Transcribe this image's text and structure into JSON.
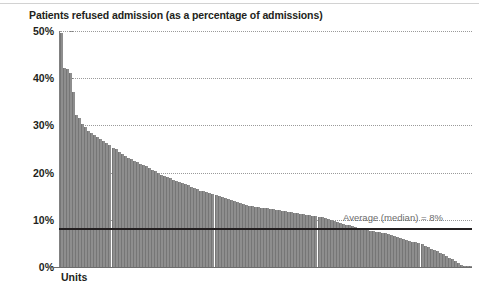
{
  "chart_data": {
    "type": "bar",
    "title": "Patients refused admission (as a percentage of admissions)",
    "xlabel": "Units",
    "ylabel": "",
    "ylim": [
      0,
      50
    ],
    "xlim": [
      0,
      136
    ],
    "ytick_labels": [
      "50%",
      "40%",
      "30%",
      "20%",
      "10%",
      "0%"
    ],
    "ytick_values": [
      50,
      40,
      30,
      20,
      10,
      0
    ],
    "grid": true,
    "legend": "none",
    "series_name": "Patients refused admission",
    "bar_color": "#8e8e8e",
    "annotations": [
      {
        "name": "average-median-line",
        "label": "Average (median) = 8%",
        "value": 8,
        "color": "#231f20"
      }
    ],
    "categories": [
      "1",
      "2",
      "3",
      "4",
      "5",
      "6",
      "7",
      "8",
      "9",
      "10",
      "11",
      "12",
      "13",
      "14",
      "15",
      "16",
      "17",
      "18",
      "19",
      "20",
      "21",
      "22",
      "23",
      "24",
      "25",
      "26",
      "27",
      "28",
      "29",
      "30",
      "31",
      "32",
      "33",
      "34",
      "35",
      "36",
      "37",
      "38",
      "39",
      "40",
      "41",
      "42",
      "43",
      "44",
      "45",
      "46",
      "47",
      "48",
      "49",
      "50",
      "51",
      "52",
      "53",
      "54",
      "55",
      "56",
      "57",
      "58",
      "59",
      "60",
      "61",
      "62",
      "63",
      "64",
      "65",
      "66",
      "67",
      "68",
      "69",
      "70",
      "71",
      "72",
      "73",
      "74",
      "75",
      "76",
      "77",
      "78",
      "79",
      "80",
      "81",
      "82",
      "83",
      "84",
      "85",
      "86",
      "87",
      "88",
      "89",
      "90",
      "91",
      "92",
      "93",
      "94",
      "95",
      "96",
      "97",
      "98",
      "99",
      "100",
      "101",
      "102",
      "103",
      "104",
      "105",
      "106",
      "107",
      "108",
      "109",
      "110",
      "111",
      "112",
      "113",
      "114",
      "115",
      "116",
      "117",
      "118",
      "119",
      "120",
      "121",
      "122",
      "123",
      "124",
      "125",
      "126",
      "127",
      "128",
      "129",
      "130",
      "131",
      "132",
      "133",
      "134",
      "135",
      "136"
    ],
    "values": [
      49.5,
      42.2,
      42.0,
      41.2,
      37.0,
      32.3,
      31.5,
      30.2,
      29.6,
      28.8,
      28.3,
      28.0,
      27.6,
      27.2,
      26.8,
      26.3,
      25.8,
      25.3,
      24.9,
      24.4,
      24.0,
      23.6,
      23.2,
      22.8,
      22.5,
      22.2,
      21.9,
      21.6,
      21.3,
      21.0,
      20.6,
      20.3,
      20.0,
      19.6,
      19.3,
      19.0,
      18.8,
      18.5,
      18.2,
      18.0,
      17.8,
      17.6,
      17.3,
      17.0,
      16.8,
      16.5,
      16.2,
      16.0,
      15.8,
      15.6,
      15.4,
      15.2,
      15.0,
      14.8,
      14.6,
      14.4,
      14.2,
      14.0,
      13.8,
      13.6,
      13.4,
      13.2,
      13.0,
      12.9,
      12.8,
      12.7,
      12.6,
      12.5,
      12.4,
      12.3,
      12.2,
      12.1,
      12.0,
      11.9,
      11.8,
      11.7,
      11.6,
      11.5,
      11.4,
      11.3,
      11.2,
      11.1,
      11.0,
      10.9,
      10.8,
      10.6,
      10.5,
      10.3,
      10.2,
      10.0,
      9.8,
      9.6,
      9.4,
      9.2,
      9.0,
      8.8,
      8.6,
      8.4,
      8.2,
      8.0,
      7.9,
      7.8,
      7.7,
      7.6,
      7.5,
      7.4,
      7.3,
      7.2,
      7.0,
      6.8,
      6.6,
      6.4,
      6.2,
      6.0,
      5.8,
      5.6,
      5.4,
      5.2,
      5.0,
      4.8,
      4.5,
      4.2,
      3.9,
      3.6,
      3.3,
      3.0,
      2.7,
      2.4,
      2.0,
      1.6,
      1.2,
      0.8,
      0.5,
      0.3,
      0.15,
      0.05
    ]
  }
}
